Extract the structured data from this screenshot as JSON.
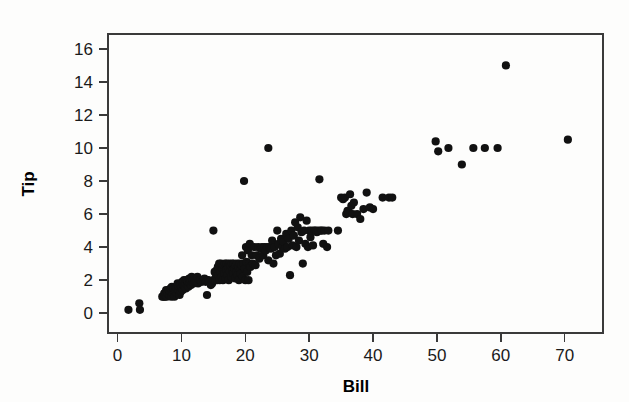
{
  "chart_data": {
    "type": "scatter",
    "title": "",
    "xlabel": "Bill",
    "ylabel": "Tip",
    "xlim": [
      -1.5,
      76
    ],
    "ylim": [
      -1.2,
      16.9
    ],
    "xticks": [
      0,
      10,
      20,
      30,
      40,
      50,
      60,
      70
    ],
    "yticks": [
      0,
      2,
      4,
      6,
      8,
      10,
      12,
      14,
      16
    ],
    "xtick_labels": [
      "0",
      "10",
      "20",
      "30",
      "40",
      "50",
      "60",
      "70"
    ],
    "ytick_labels": [
      "0",
      "2",
      "4",
      "6",
      "8",
      "10",
      "12",
      "14",
      "16"
    ],
    "grid": false,
    "legend": null,
    "marker": "filled-circle",
    "marker_color": "#111111",
    "marker_size": 4.1,
    "n_points": 243,
    "points": [
      [
        1.7,
        0.2
      ],
      [
        3.4,
        0.6
      ],
      [
        3.5,
        0.2
      ],
      [
        7.0,
        1.0
      ],
      [
        7.2,
        1.0
      ],
      [
        7.3,
        1.2
      ],
      [
        7.4,
        1.0
      ],
      [
        7.5,
        1.1
      ],
      [
        7.6,
        1.4
      ],
      [
        7.7,
        1.0
      ],
      [
        7.8,
        1.2
      ],
      [
        8.0,
        1.4
      ],
      [
        8.1,
        1.1
      ],
      [
        8.2,
        1.3
      ],
      [
        8.3,
        1.5
      ],
      [
        8.4,
        1.0
      ],
      [
        8.5,
        1.6
      ],
      [
        8.6,
        1.2
      ],
      [
        8.7,
        1.4
      ],
      [
        8.8,
        1.5
      ],
      [
        8.9,
        1.0
      ],
      [
        9.0,
        1.3
      ],
      [
        9.1,
        1.6
      ],
      [
        9.2,
        1.5
      ],
      [
        9.3,
        1.2
      ],
      [
        9.4,
        1.8
      ],
      [
        9.5,
        1.4
      ],
      [
        9.6,
        1.6
      ],
      [
        9.7,
        1.1
      ],
      [
        9.8,
        1.7
      ],
      [
        9.9,
        1.3
      ],
      [
        10.0,
        1.5
      ],
      [
        10.1,
        1.9
      ],
      [
        10.2,
        1.4
      ],
      [
        10.3,
        1.7
      ],
      [
        10.4,
        2.0
      ],
      [
        10.5,
        1.6
      ],
      [
        10.6,
        1.8
      ],
      [
        10.7,
        1.5
      ],
      [
        10.8,
        2.0
      ],
      [
        10.9,
        1.7
      ],
      [
        11.0,
        1.9
      ],
      [
        11.1,
        1.6
      ],
      [
        11.2,
        2.1
      ],
      [
        11.3,
        1.8
      ],
      [
        11.4,
        2.0
      ],
      [
        11.5,
        1.7
      ],
      [
        11.6,
        2.2
      ],
      [
        11.7,
        1.9
      ],
      [
        11.8,
        2.0
      ],
      [
        11.9,
        1.8
      ],
      [
        12.0,
        2.1
      ],
      [
        12.1,
        1.9
      ],
      [
        12.2,
        2.0
      ],
      [
        12.4,
        2.0
      ],
      [
        12.5,
        2.2
      ],
      [
        12.6,
        1.8
      ],
      [
        12.8,
        2.0
      ],
      [
        13.0,
        2.0
      ],
      [
        13.2,
        1.9
      ],
      [
        13.4,
        2.0
      ],
      [
        13.6,
        2.1
      ],
      [
        13.8,
        1.9
      ],
      [
        14.0,
        1.1
      ],
      [
        14.0,
        2.0
      ],
      [
        14.2,
        2.0
      ],
      [
        14.4,
        1.9
      ],
      [
        14.6,
        1.7
      ],
      [
        14.8,
        1.8
      ],
      [
        15.0,
        5.0
      ],
      [
        15.0,
        2.0
      ],
      [
        15.2,
        2.5
      ],
      [
        15.3,
        2.0
      ],
      [
        15.4,
        2.2
      ],
      [
        15.5,
        2.6
      ],
      [
        15.6,
        2.0
      ],
      [
        15.7,
        2.8
      ],
      [
        15.8,
        2.3
      ],
      [
        15.9,
        3.0
      ],
      [
        16.0,
        2.0
      ],
      [
        16.1,
        2.5
      ],
      [
        16.2,
        3.0
      ],
      [
        16.3,
        2.2
      ],
      [
        16.4,
        2.7
      ],
      [
        16.5,
        2.0
      ],
      [
        16.6,
        2.9
      ],
      [
        16.7,
        2.4
      ],
      [
        16.8,
        3.0
      ],
      [
        16.9,
        2.1
      ],
      [
        17.0,
        2.6
      ],
      [
        17.1,
        3.0
      ],
      [
        17.2,
        2.3
      ],
      [
        17.3,
        2.8
      ],
      [
        17.4,
        2.0
      ],
      [
        17.5,
        3.0
      ],
      [
        17.6,
        2.5
      ],
      [
        17.7,
        2.9
      ],
      [
        17.8,
        2.2
      ],
      [
        17.9,
        3.0
      ],
      [
        18.0,
        2.6
      ],
      [
        18.1,
        2.4
      ],
      [
        18.2,
        3.0
      ],
      [
        18.3,
        2.7
      ],
      [
        18.4,
        2.1
      ],
      [
        18.5,
        2.9
      ],
      [
        18.6,
        2.5
      ],
      [
        18.7,
        3.0
      ],
      [
        18.8,
        2.3
      ],
      [
        18.9,
        2.8
      ],
      [
        19.0,
        2.0
      ],
      [
        19.1,
        3.0
      ],
      [
        19.2,
        2.6
      ],
      [
        19.3,
        2.4
      ],
      [
        19.4,
        2.9
      ],
      [
        19.5,
        3.5
      ],
      [
        19.6,
        2.2
      ],
      [
        19.7,
        3.0
      ],
      [
        19.8,
        8.0
      ],
      [
        19.9,
        2.7
      ],
      [
        20.0,
        2.0
      ],
      [
        20.1,
        4.0
      ],
      [
        20.2,
        3.1
      ],
      [
        20.3,
        2.5
      ],
      [
        20.4,
        3.8
      ],
      [
        20.5,
        2.0
      ],
      [
        20.6,
        3.0
      ],
      [
        20.7,
        4.2
      ],
      [
        20.8,
        2.8
      ],
      [
        21.0,
        3.5
      ],
      [
        21.2,
        3.0
      ],
      [
        21.4,
        4.0
      ],
      [
        21.6,
        2.9
      ],
      [
        21.8,
        3.5
      ],
      [
        22.0,
        4.0
      ],
      [
        22.2,
        3.3
      ],
      [
        22.4,
        3.9
      ],
      [
        22.6,
        4.0
      ],
      [
        22.8,
        3.5
      ],
      [
        23.0,
        4.0
      ],
      [
        23.2,
        3.8
      ],
      [
        23.4,
        4.0
      ],
      [
        23.6,
        10.0
      ],
      [
        23.6,
        3.2
      ],
      [
        23.8,
        4.0
      ],
      [
        24.0,
        3.9
      ],
      [
        24.2,
        4.4
      ],
      [
        24.4,
        3.0
      ],
      [
        24.6,
        4.0
      ],
      [
        24.8,
        3.5
      ],
      [
        25.0,
        5.0
      ],
      [
        25.2,
        4.2
      ],
      [
        25.4,
        3.6
      ],
      [
        25.6,
        4.5
      ],
      [
        25.8,
        4.0
      ],
      [
        26.0,
        4.3
      ],
      [
        26.2,
        3.9
      ],
      [
        26.4,
        4.8
      ],
      [
        26.6,
        4.0
      ],
      [
        26.8,
        4.5
      ],
      [
        27.0,
        2.3
      ],
      [
        27.2,
        5.0
      ],
      [
        27.4,
        4.1
      ],
      [
        27.6,
        4.7
      ],
      [
        27.8,
        5.5
      ],
      [
        28.0,
        4.0
      ],
      [
        28.2,
        5.2
      ],
      [
        28.4,
        4.4
      ],
      [
        28.6,
        5.8
      ],
      [
        28.8,
        4.9
      ],
      [
        29.0,
        3.0
      ],
      [
        29.2,
        5.0
      ],
      [
        29.4,
        4.2
      ],
      [
        29.6,
        5.6
      ],
      [
        29.8,
        4.0
      ],
      [
        30.0,
        5.0
      ],
      [
        30.2,
        4.6
      ],
      [
        30.4,
        5.0
      ],
      [
        30.6,
        4.1
      ],
      [
        30.8,
        5.0
      ],
      [
        31.0,
        5.0
      ],
      [
        31.2,
        4.9
      ],
      [
        31.4,
        5.0
      ],
      [
        31.6,
        8.1
      ],
      [
        31.8,
        5.0
      ],
      [
        32.0,
        5.0
      ],
      [
        32.2,
        4.2
      ],
      [
        32.4,
        5.0
      ],
      [
        32.8,
        4.0
      ],
      [
        33.0,
        5.0
      ],
      [
        34.5,
        5.0
      ],
      [
        35.0,
        7.0
      ],
      [
        35.3,
        6.9
      ],
      [
        35.6,
        7.0
      ],
      [
        35.8,
        6.0
      ],
      [
        36.0,
        6.2
      ],
      [
        36.2,
        6.1
      ],
      [
        36.4,
        7.2
      ],
      [
        36.6,
        6.5
      ],
      [
        36.8,
        6.0
      ],
      [
        37.0,
        6.7
      ],
      [
        37.5,
        6.0
      ],
      [
        38.0,
        5.7
      ],
      [
        38.5,
        6.3
      ],
      [
        39.0,
        7.3
      ],
      [
        39.5,
        6.4
      ],
      [
        40.0,
        6.3
      ],
      [
        41.5,
        7.0
      ],
      [
        42.5,
        7.0
      ],
      [
        43.0,
        7.0
      ],
      [
        49.8,
        10.4
      ],
      [
        50.2,
        9.8
      ],
      [
        51.8,
        10.0
      ],
      [
        53.9,
        9.0
      ],
      [
        55.7,
        10.0
      ],
      [
        57.5,
        10.0
      ],
      [
        59.5,
        10.0
      ],
      [
        60.8,
        15.0
      ],
      [
        70.5,
        10.5
      ]
    ]
  },
  "axes": {
    "x_title": "Bill",
    "y_title": "Tip"
  }
}
